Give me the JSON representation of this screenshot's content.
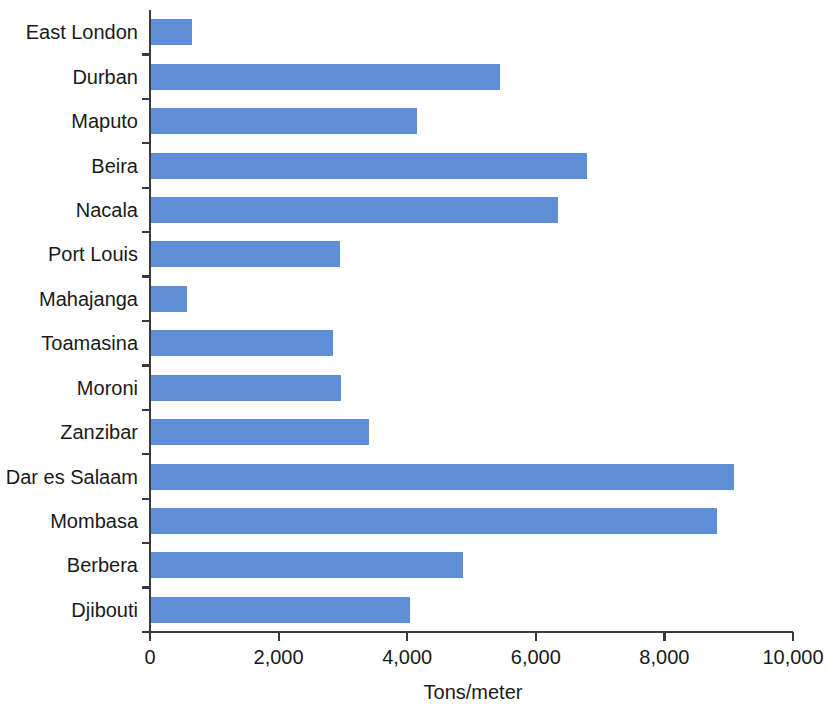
{
  "chart_data": {
    "type": "bar",
    "orientation": "horizontal",
    "title": "",
    "subtitle": "",
    "xlabel": "Tons/meter",
    "ylabel": "",
    "categories": [
      "East London",
      "Durban",
      "Maputo",
      "Beira",
      "Nacala",
      "Port Louis",
      "Mahajanga",
      "Toamasina",
      "Moroni",
      "Zanzibar",
      "Dar es Salaam",
      "Mombasa",
      "Berbera",
      "Djibouti"
    ],
    "values": [
      650,
      5450,
      4150,
      6800,
      6350,
      2950,
      570,
      2850,
      2970,
      3400,
      9080,
      8820,
      4870,
      4050
    ],
    "xlim": [
      0,
      10000
    ],
    "xticks": [
      0,
      2000,
      4000,
      6000,
      8000,
      10000
    ],
    "xtick_labels": [
      "0",
      "2,000",
      "4,000",
      "6,000",
      "8,000",
      "10,000"
    ],
    "grid": false,
    "legend": false,
    "legend_position": "none",
    "bar_color": "#5E8FD6",
    "axis_color": "#3A3A3A",
    "background_color": "#FFFFFF"
  }
}
